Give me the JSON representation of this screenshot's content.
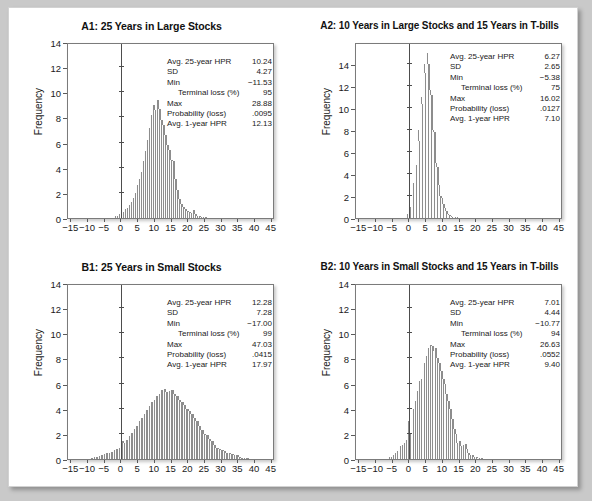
{
  "figure": {
    "background": "#ffffff",
    "bar_color": "#8d8d8d",
    "axis_color": "#4d4d4d",
    "ylabel": "Frequency",
    "xticks": [
      "-15",
      "-10",
      "-5",
      "0",
      "5",
      "10",
      "15",
      "20",
      "25",
      "30",
      "35",
      "40",
      "45"
    ],
    "xtick_values": [
      -15,
      -10,
      -5,
      0,
      5,
      10,
      15,
      20,
      25,
      30,
      35,
      40,
      45
    ],
    "stat_labels": {
      "avg25": "Avg. 25-year HPR",
      "sd": "SD",
      "min": "Min",
      "terminal": "Terminal loss (%)",
      "max": "Max",
      "prob": "Probability (loss)",
      "avg1": "Avg. 1-year HPR"
    }
  },
  "panels": [
    {
      "id": "A1",
      "title": "A1: 25 Years in Large Stocks",
      "stats": {
        "avg25": "10.24",
        "sd": "4.27",
        "min": "−11.53",
        "terminal": "95",
        "max": "28.88",
        "prob": ".0095",
        "avg1": "12.13"
      }
    },
    {
      "id": "A2",
      "title": "A2: 10 Years in Large Stocks and 15 Years in T-bills",
      "stats": {
        "avg25": "6.27",
        "sd": "2.65",
        "min": "−5.38",
        "terminal": "75",
        "max": "16.02",
        "prob": ".0127",
        "avg1": "7.10"
      }
    },
    {
      "id": "B1",
      "title": "B1: 25 Years in Small Stocks",
      "stats": {
        "avg25": "12.28",
        "sd": "7.28",
        "min": "−17.00",
        "terminal": "99",
        "max": "47.03",
        "prob": ".0415",
        "avg1": "17.97"
      }
    },
    {
      "id": "B2",
      "title": "B2: 10 Years in Small Stocks and 15 Years in T-bills",
      "stats": {
        "avg25": "7.01",
        "sd": "4.44",
        "min": "−10.77",
        "terminal": "94",
        "max": "26.63",
        "prob": ".0552",
        "avg1": "9.40"
      }
    }
  ],
  "chart_data": [
    {
      "type": "bar",
      "panel": "A1",
      "title": "A1: 25 Years in Large Stocks",
      "xlabel": "",
      "ylabel": "Frequency",
      "xlim": [
        -16,
        46
      ],
      "ylim": [
        0,
        14
      ],
      "yticks": [
        0,
        2,
        4,
        6,
        8,
        10,
        12,
        14
      ],
      "ytick_labels": [
        "0",
        "2",
        "4",
        "6",
        "8",
        "10",
        "12",
        "14"
      ],
      "bin_width": 0.6,
      "grid": false,
      "x": [
        -2.0,
        -1.4,
        -0.8,
        -0.2,
        0.4,
        1.0,
        1.6,
        2.2,
        2.8,
        3.4,
        4.0,
        4.6,
        5.2,
        5.8,
        6.4,
        7.0,
        7.6,
        8.2,
        8.8,
        9.4,
        10.0,
        10.6,
        11.2,
        11.8,
        12.4,
        13.0,
        13.6,
        14.2,
        14.8,
        15.4,
        16.0,
        16.6,
        17.2,
        17.8,
        18.4,
        19.0,
        19.6,
        20.2,
        20.8,
        21.4,
        22.0,
        22.6,
        23.2,
        23.8,
        24.4,
        25.0
      ],
      "values": [
        0.15,
        0.2,
        0.3,
        0.45,
        0.5,
        0.7,
        0.8,
        1.0,
        1.25,
        1.6,
        2.0,
        2.6,
        3.1,
        3.7,
        4.5,
        5.3,
        6.2,
        7.2,
        8.2,
        9.0,
        8.6,
        9.4,
        8.7,
        7.8,
        7.4,
        6.6,
        5.8,
        5.4,
        4.6,
        4.5,
        3.1,
        2.2,
        1.5,
        1.1,
        0.9,
        0.7,
        0.55,
        0.5,
        0.4,
        0.6,
        0.35,
        0.2,
        0.15,
        0.1,
        0.08,
        0.05
      ]
    },
    {
      "type": "bar",
      "panel": "A2",
      "title": "A2: 10 Years in Large Stocks and 15 Years in T-bills",
      "xlabel": "",
      "ylabel": "Frequency",
      "xlim": [
        -16,
        46
      ],
      "ylim": [
        0,
        16
      ],
      "yticks": [
        0,
        2,
        4,
        6,
        8,
        10,
        12,
        14
      ],
      "ytick_labels": [
        "0",
        "2",
        "4",
        "6",
        "8",
        "10",
        "12",
        "14"
      ],
      "bin_width": 0.45,
      "grid": false,
      "x": [
        -1.2,
        -0.75,
        -0.3,
        0.15,
        0.6,
        1.05,
        1.5,
        1.95,
        2.4,
        2.85,
        3.3,
        3.75,
        4.2,
        4.65,
        5.1,
        5.55,
        6.0,
        6.45,
        6.9,
        7.35,
        7.8,
        8.25,
        8.7,
        9.15,
        9.6,
        10.05,
        10.5,
        10.95,
        11.4,
        11.85,
        12.3,
        12.75,
        13.2,
        13.65,
        14.1
      ],
      "values": [
        0.2,
        0.4,
        1.2,
        1.0,
        1.6,
        3.2,
        3.3,
        4.8,
        8.0,
        7.0,
        11.0,
        10.4,
        14.0,
        13.2,
        15.0,
        14.0,
        11.6,
        11.2,
        8.0,
        7.8,
        5.0,
        4.6,
        3.0,
        2.0,
        1.8,
        1.3,
        0.9,
        0.6,
        0.35,
        0.25,
        0.15,
        0.1,
        0.08,
        0.05,
        0.03
      ]
    },
    {
      "type": "bar",
      "panel": "B1",
      "title": "B1: 25 Years in Small Stocks",
      "xlabel": "",
      "ylabel": "Frequency",
      "xlim": [
        -16,
        46
      ],
      "ylim": [
        0,
        14
      ],
      "yticks": [
        0,
        2,
        4,
        6,
        8,
        10,
        12,
        14
      ],
      "ytick_labels": [
        "0",
        "2",
        "4",
        "6",
        "8",
        "10",
        "12",
        "14"
      ],
      "bin_width": 0.75,
      "grid": false,
      "x": [
        -9.0,
        -8.25,
        -7.5,
        -6.75,
        -6.0,
        -5.25,
        -4.5,
        -3.75,
        -3.0,
        -2.25,
        -1.5,
        -0.75,
        0.0,
        0.75,
        1.5,
        2.25,
        3.0,
        3.75,
        4.5,
        5.25,
        6.0,
        6.75,
        7.5,
        8.25,
        9.0,
        9.75,
        10.5,
        11.25,
        12.0,
        12.75,
        13.5,
        14.25,
        15.0,
        15.75,
        16.5,
        17.25,
        18.0,
        18.75,
        19.5,
        20.25,
        21.0,
        21.75,
        22.5,
        23.25,
        24.0,
        24.75,
        25.5,
        26.25,
        27.0,
        27.75,
        28.5,
        29.25,
        30.0,
        30.75,
        31.5,
        32.25,
        33.0,
        33.75,
        34.5,
        35.25,
        36.0,
        36.75,
        37.5
      ],
      "values": [
        0.1,
        0.15,
        0.2,
        0.25,
        0.3,
        0.4,
        0.45,
        0.5,
        0.55,
        0.7,
        0.8,
        0.9,
        1.4,
        1.3,
        1.5,
        1.8,
        2.1,
        2.4,
        2.6,
        3.0,
        3.3,
        3.6,
        3.9,
        4.2,
        4.5,
        4.7,
        5.0,
        5.2,
        5.5,
        5.6,
        5.3,
        5.4,
        5.5,
        5.2,
        5.0,
        4.7,
        4.5,
        4.3,
        4.0,
        3.8,
        3.6,
        3.3,
        3.0,
        2.6,
        2.3,
        2.0,
        1.9,
        1.6,
        1.4,
        1.1,
        0.9,
        0.8,
        0.7,
        0.6,
        0.5,
        0.45,
        0.4,
        0.35,
        0.3,
        0.2,
        0.12,
        0.08,
        0.05
      ]
    },
    {
      "type": "bar",
      "panel": "B2",
      "title": "B2: 10 Years in Small Stocks and 15 Years in T-bills",
      "xlabel": "",
      "ylabel": "Frequency",
      "xlim": [
        -16,
        46
      ],
      "ylim": [
        0,
        14
      ],
      "yticks": [
        0,
        2,
        4,
        6,
        8,
        10,
        12,
        14
      ],
      "ytick_labels": [
        "0",
        "2",
        "4",
        "6",
        "8",
        "10",
        "12",
        "14"
      ],
      "bin_width": 0.55,
      "grid": false,
      "x": [
        -6.0,
        -5.45,
        -4.9,
        -4.35,
        -3.8,
        -3.25,
        -2.7,
        -2.15,
        -1.6,
        -1.05,
        -0.5,
        0.05,
        0.6,
        1.15,
        1.7,
        2.25,
        2.8,
        3.35,
        3.9,
        4.45,
        5.0,
        5.55,
        6.1,
        6.65,
        7.2,
        7.75,
        8.3,
        8.85,
        9.4,
        9.95,
        10.5,
        11.05,
        11.6,
        12.15,
        12.7,
        13.25,
        13.8,
        14.35,
        14.9,
        15.45,
        16.0,
        16.55,
        17.1,
        17.65,
        18.2,
        18.75,
        19.3,
        19.85,
        20.4,
        20.95,
        21.5
      ],
      "values": [
        0.15,
        0.2,
        0.35,
        0.5,
        0.6,
        0.8,
        1.0,
        1.1,
        1.3,
        1.5,
        3.0,
        2.0,
        3.3,
        4.0,
        4.6,
        5.4,
        6.2,
        6.4,
        7.0,
        7.6,
        8.2,
        8.8,
        9.1,
        9.0,
        8.6,
        8.8,
        8.0,
        7.6,
        7.0,
        6.4,
        6.0,
        5.2,
        4.6,
        4.0,
        3.2,
        2.4,
        2.0,
        1.3,
        1.4,
        1.0,
        1.1,
        1.2,
        0.8,
        0.5,
        0.35,
        0.3,
        0.2,
        0.15,
        0.1,
        0.07,
        0.05
      ]
    }
  ]
}
